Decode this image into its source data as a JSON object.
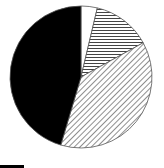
{
  "chart_data": {
    "type": "pie",
    "title": "",
    "start_angle_deg": 0,
    "direction": "clockwise",
    "slices": [
      {
        "label": "",
        "value": 3.7,
        "fill": "white"
      },
      {
        "label": "",
        "value": 13.3,
        "fill": "horizontal-hatch"
      },
      {
        "label": "",
        "value": 37.6,
        "fill": "diagonal-hatch"
      },
      {
        "label": "",
        "value": 45.4,
        "fill": "black"
      }
    ],
    "legend": "none",
    "colors": {
      "stroke": "#555555",
      "solid": "#000000",
      "background": "#ffffff"
    }
  }
}
